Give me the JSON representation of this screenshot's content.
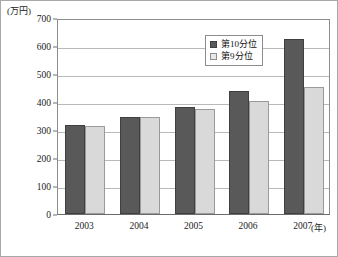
{
  "chart_data": {
    "type": "bar",
    "title": "",
    "xlabel": "(年)",
    "ylabel": "(万円)",
    "categories": [
      "2003",
      "2004",
      "2005",
      "2006",
      "2007"
    ],
    "series": [
      {
        "name": "第10分位",
        "color": "#595959",
        "values": [
          318,
          348,
          383,
          440,
          625
        ]
      },
      {
        "name": "第9分位",
        "color": "#d9d9d9",
        "values": [
          313,
          347,
          375,
          402,
          452
        ]
      }
    ],
    "ylim": [
      0,
      700
    ],
    "ytick_values": [
      0,
      100,
      200,
      300,
      400,
      500,
      600,
      700
    ],
    "ytick_labels": [
      "0",
      "100",
      "200",
      "300",
      "400",
      "500",
      "600",
      "700"
    ],
    "grid": true,
    "legend_position": "top-right"
  },
  "legend": {
    "items": [
      {
        "label": "第10分位",
        "swatch": "dark-square-icon"
      },
      {
        "label": "第9分位",
        "swatch": "light-square-icon"
      }
    ]
  }
}
